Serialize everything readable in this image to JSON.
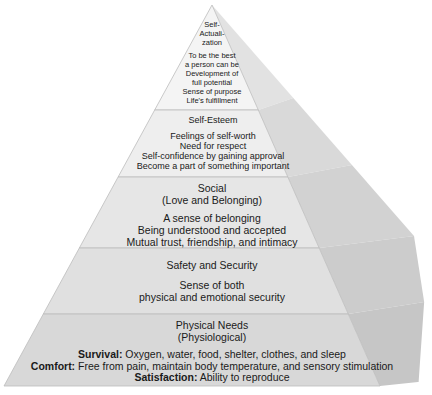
{
  "diagram": {
    "type": "pyramid",
    "colors": {
      "background": "#ffffff",
      "text": "#1a1a1a",
      "tier_fronts": [
        "#f4f4f4",
        "#eeeeee",
        "#e6e6e6",
        "#e0e0e0",
        "#d8d8d8"
      ],
      "side_faces": [
        "#e2e2e2",
        "#d9d9d9",
        "#d2d2d2",
        "#cccccc",
        "#c6c6c6"
      ],
      "divider": "#bdbdbd"
    },
    "tiers": [
      {
        "id": "self-actualization",
        "title_lines": [
          "Self-",
          "Actuali-",
          "zation"
        ],
        "items": [
          "To be the best",
          "a person can be",
          "Development of",
          "full potential",
          "Sense of purpose",
          "Life's fulfillment"
        ]
      },
      {
        "id": "self-esteem",
        "title_lines": [
          "Self-Esteem"
        ],
        "items": [
          "Feelings of self-worth",
          "Need for respect",
          "Self-confidence by gaining approval",
          "Become a part of something important"
        ]
      },
      {
        "id": "social",
        "title_lines": [
          "Social",
          "(Love and Belonging)"
        ],
        "items": [
          "A sense of belonging",
          "Being understood and accepted",
          "Mutual trust, friendship, and intimacy"
        ]
      },
      {
        "id": "safety",
        "title_lines": [
          "Safety and Security"
        ],
        "items": [
          "Sense of both",
          "physical and emotional security"
        ]
      },
      {
        "id": "physical",
        "title_lines": [
          "Physical Needs",
          "(Physiological)"
        ],
        "items": [
          {
            "label": "Survival:",
            "text": " Oxygen, water, food, shelter, clothes, and sleep"
          },
          {
            "label": "Comfort:",
            "text": " Free from pain, maintain body temperature, and sensory stimulation"
          },
          {
            "label": "Satisfaction:",
            "text": " Ability to reproduce"
          }
        ]
      }
    ]
  }
}
